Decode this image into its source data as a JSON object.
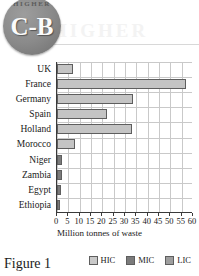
{
  "badge": {
    "arc_text": "HIGHER",
    "main_text": "C-B"
  },
  "watermark": "HIGHER",
  "caption": "Figure 1",
  "chart_data": {
    "type": "bar",
    "orientation": "horizontal",
    "title": "",
    "xlabel": "Million tonnes of waste",
    "ylabel": "",
    "xlim": [
      0,
      60
    ],
    "xticks": [
      0,
      5,
      10,
      15,
      20,
      25,
      30,
      35,
      40,
      45,
      50,
      55,
      60
    ],
    "grid": true,
    "legend_position": "bottom-right",
    "categories": [
      "UK",
      "France",
      "Germany",
      "Spain",
      "Holland",
      "Morocco",
      "Niger",
      "Zambia",
      "Egypt",
      "Ethiopia"
    ],
    "values": [
      7,
      57,
      33.5,
      22,
      33,
      8,
      2.2,
      2.2,
      1.8,
      1.2
    ],
    "group_of": [
      "HIC",
      "HIC",
      "HIC",
      "HIC",
      "HIC",
      "HIC",
      "MIC",
      "MIC",
      "MIC",
      "MIC"
    ],
    "legend": [
      {
        "key": "hic",
        "label": "HIC",
        "color": "#c9c9c9"
      },
      {
        "key": "mic",
        "label": "MIC",
        "color": "#7b7b7b"
      },
      {
        "key": "lic",
        "label": "LIC",
        "color": "#9e9e9e"
      }
    ]
  }
}
